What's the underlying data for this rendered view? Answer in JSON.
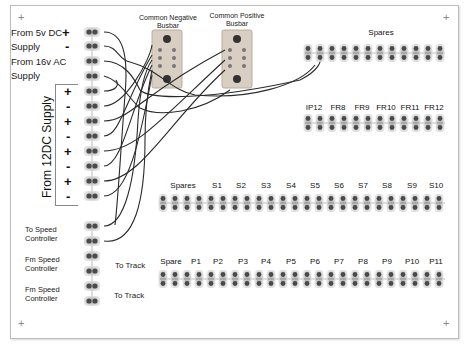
{
  "diagram": {
    "busbars": {
      "negative": {
        "line1": "Common Negative",
        "line2": "Busbar"
      },
      "positive": {
        "line1": "Common Positive",
        "line2": "Busbar"
      }
    },
    "left_inputs": {
      "dc5": {
        "line1": "From 5v DC",
        "line2": "Supply",
        "plus": "+",
        "minus": "-"
      },
      "ac16": {
        "line1": "From 16v AC",
        "line2": "Supply"
      },
      "dc12": {
        "label": "From 12DC Supply",
        "signs": [
          "+",
          "-",
          "+",
          "-",
          "+",
          "-",
          "+",
          "-"
        ]
      }
    },
    "controllers": {
      "to_speed": {
        "line1": "To Speed",
        "line2": "Controller"
      },
      "fm_speed_1": {
        "line1": "Fm Speed",
        "line2": "Controller",
        "to_track": "To Track"
      },
      "fm_speed_2": {
        "line1": "Fm Speed",
        "line2": "Controller",
        "to_track": "To Track"
      }
    },
    "top_right": {
      "header": "Spares",
      "row_labels": [
        "IP12",
        "FR8",
        "FR9",
        "FR10",
        "FR11",
        "FR12"
      ]
    },
    "s_row": {
      "labels": [
        "Spares",
        "S1",
        "S2",
        "S3",
        "S4",
        "S5",
        "S6",
        "S7",
        "S8",
        "S9",
        "S10"
      ]
    },
    "p_row": {
      "labels": [
        "Spare",
        "P1",
        "P2",
        "P3",
        "P4",
        "P5",
        "P6",
        "P7",
        "P8",
        "P9",
        "P10",
        "P11"
      ]
    },
    "corner_marks": [
      "+",
      "+",
      "+",
      "+"
    ],
    "colors": {
      "wire": "#2a2a2a",
      "terminal_dot": "#555555",
      "terminal_bg": "#d9d9d9",
      "busbar": "#d8cfc2",
      "frame": "#bdbdbd"
    }
  }
}
